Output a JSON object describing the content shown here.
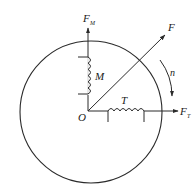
{
  "diagram": {
    "type": "motor-phasor-diagram",
    "circle": {
      "cx": 91,
      "cy": 112,
      "r": 71
    },
    "origin": {
      "label": "O",
      "x": 88,
      "y": 111
    },
    "vectors": [
      {
        "id": "FM",
        "label": "F",
        "subscript": "M",
        "direction": "up",
        "from": [
          88,
          111
        ],
        "to": [
          88,
          27
        ]
      },
      {
        "id": "F",
        "label": "F",
        "subscript": "",
        "direction": "diagonal-up-right",
        "from": [
          88,
          111
        ],
        "to": [
          166,
          34
        ]
      },
      {
        "id": "FT",
        "label": "F",
        "subscript": "T",
        "direction": "right",
        "from": [
          88,
          111
        ],
        "to": [
          179,
          111
        ]
      }
    ],
    "windings": [
      {
        "id": "M",
        "label": "M",
        "orientation": "vertical",
        "axis": "FM"
      },
      {
        "id": "T",
        "label": "T",
        "orientation": "horizontal",
        "axis": "FT"
      }
    ],
    "rotation": {
      "label": "n",
      "direction": "clockwise"
    },
    "colors": {
      "line": "#2a2a2a",
      "text": "#1a1a1a",
      "background": "#ffffff"
    }
  }
}
